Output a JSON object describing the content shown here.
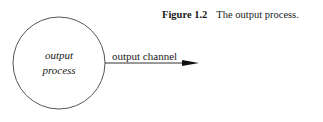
{
  "caption": {
    "number": "Figure 1.2",
    "text": "The output process."
  },
  "diagram": {
    "node": {
      "shape": "circle",
      "line1": "output",
      "line2": "process"
    },
    "edge": {
      "label": "output channel",
      "direction": "right"
    }
  }
}
